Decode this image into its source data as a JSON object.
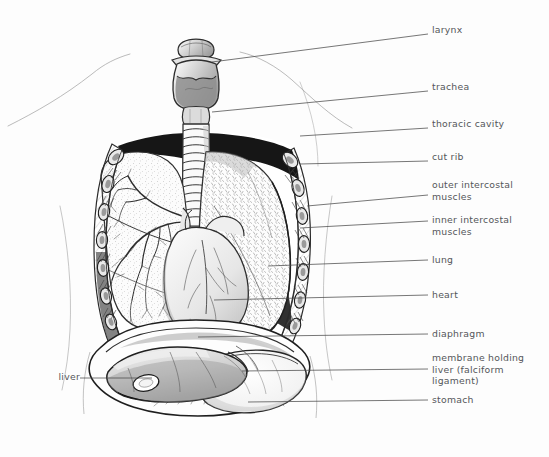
{
  "figure": {
    "background_color": "#fdfdfd",
    "ink_color": "#2b2b2b",
    "label_color": "#54565a"
  },
  "labels": [
    {
      "id": "larynx",
      "text": "larynx",
      "x": 432,
      "y": 30,
      "side": "right",
      "leader": {
        "x1": 406,
        "y1": 36,
        "x2": 428,
        "y2": 34
      }
    },
    {
      "id": "trachea",
      "text": "trachea",
      "x": 432,
      "y": 87,
      "side": "right",
      "leader": {
        "x1": 400,
        "y1": 96,
        "x2": 428,
        "y2": 91
      }
    },
    {
      "id": "thoracic-cavity",
      "text": "thoracic cavity",
      "x": 432,
      "y": 124,
      "side": "right",
      "leader": {
        "x1": 398,
        "y1": 131,
        "x2": 428,
        "y2": 128
      }
    },
    {
      "id": "cut-rib",
      "text": "cut rib",
      "x": 432,
      "y": 157,
      "side": "right",
      "leader": {
        "x1": 398,
        "y1": 161,
        "x2": 428,
        "y2": 161
      }
    },
    {
      "id": "outer-intercostal",
      "text": "outer intercostal\nmuscles",
      "x": 432,
      "y": 182,
      "side": "right",
      "leader": {
        "x1": 398,
        "y1": 196,
        "x2": 428,
        "y2": 195
      }
    },
    {
      "id": "inner-intercostal",
      "text": "inner intercostal\nmuscles",
      "x": 432,
      "y": 216,
      "side": "right",
      "leader": {
        "x1": 398,
        "y1": 222,
        "x2": 428,
        "y2": 221
      }
    },
    {
      "id": "lung",
      "text": "lung",
      "x": 432,
      "y": 256,
      "side": "right",
      "leader": {
        "x1": 398,
        "y1": 261,
        "x2": 428,
        "y2": 260
      }
    },
    {
      "id": "heart",
      "text": "heart",
      "x": 432,
      "y": 291,
      "side": "right",
      "leader": {
        "x1": 398,
        "y1": 296,
        "x2": 428,
        "y2": 295
      }
    },
    {
      "id": "diaphragm",
      "text": "diaphragm",
      "x": 432,
      "y": 330,
      "side": "right",
      "leader": {
        "x1": 398,
        "y1": 335,
        "x2": 428,
        "y2": 334
      }
    },
    {
      "id": "falciform",
      "text": "membrane holding\nliver (falciform\nligament)",
      "x": 432,
      "y": 354,
      "side": "right",
      "leader": {
        "x1": 398,
        "y1": 370,
        "x2": 428,
        "y2": 369
      }
    },
    {
      "id": "stomach",
      "text": "stomach",
      "x": 432,
      "y": 396,
      "side": "right",
      "leader": {
        "x1": 398,
        "y1": 401,
        "x2": 428,
        "y2": 400
      }
    },
    {
      "id": "liver",
      "text": "liver",
      "x": 52,
      "y": 373,
      "side": "left",
      "leader": {
        "x1": 60,
        "y1": 378,
        "x2": 120,
        "y2": 378
      }
    }
  ],
  "structures": [
    {
      "id": "larynx",
      "name": "larynx"
    },
    {
      "id": "trachea",
      "name": "trachea"
    },
    {
      "id": "thoracic-cavity",
      "name": "thoracic cavity"
    },
    {
      "id": "cut-rib",
      "name": "cut rib"
    },
    {
      "id": "outer-intercostal",
      "name": "outer intercostal muscles"
    },
    {
      "id": "inner-intercostal",
      "name": "inner intercostal muscles"
    },
    {
      "id": "left-lung",
      "name": "lung (cutaway, bronchial tree)"
    },
    {
      "id": "right-lung",
      "name": "lung (intact surface)"
    },
    {
      "id": "heart",
      "name": "heart"
    },
    {
      "id": "diaphragm",
      "name": "diaphragm"
    },
    {
      "id": "falciform-ligament",
      "name": "membrane holding liver (falciform ligament)"
    },
    {
      "id": "liver",
      "name": "liver"
    },
    {
      "id": "stomach",
      "name": "stomach"
    }
  ]
}
